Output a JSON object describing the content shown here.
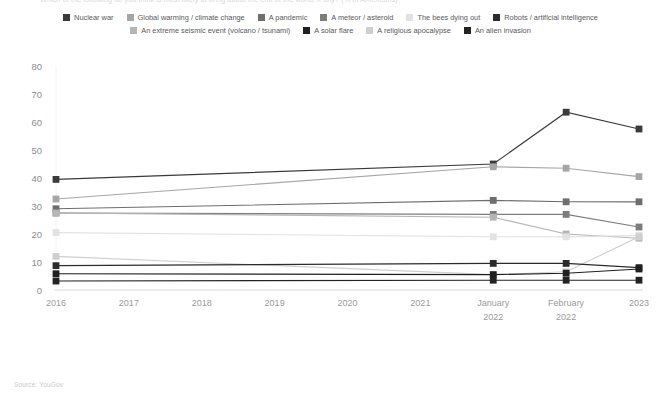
{
  "title": "Which of the following do you think is most likely to bring about the end of the world, if any? (% of Americans)",
  "source": "Source: YouGov",
  "colors": {
    "nuclear_war": "#3a3a3a",
    "global_warming": "#a6a6a6",
    "pandemic": "#6e6e6e",
    "meteor": "#7d7d7d",
    "bees": "#e2e2e2",
    "robots": "#2b2b2b",
    "seismic": "#b5b5b5",
    "solar_flare": "#1f1f1f",
    "religious": "#cfcfcf",
    "alien": "#232323",
    "axis": "#d9d9d9",
    "ytick_text": "#8d8d90",
    "xtick_text": "#9a9a9d"
  },
  "legend": {
    "rows": [
      [
        {
          "label": "Nuclear war",
          "color": "#3a3a3a",
          "swatch": "square-swatch"
        },
        {
          "label": "Global warming / climate change",
          "color": "#a6a6a6",
          "swatch": "square-swatch"
        },
        {
          "label": "A pandemic",
          "color": "#6e6e6e",
          "swatch": "square-swatch"
        },
        {
          "label": "A meteor / asteroid",
          "color": "#7d7d7d",
          "swatch": "square-swatch"
        },
        {
          "label": "The bees dying out",
          "color": "#e2e2e2",
          "swatch": "square-swatch"
        },
        {
          "label": "Robots / artificial intelligence",
          "color": "#2b2b2b",
          "swatch": "square-swatch"
        }
      ],
      [
        {
          "label": "An extreme seismic event (volcano / tsunami)",
          "color": "#b5b5b5",
          "swatch": "square-swatch"
        },
        {
          "label": "A solar flare",
          "color": "#1f1f1f",
          "swatch": "square-swatch"
        },
        {
          "label": "A religious apocalypse",
          "color": "#cfcfcf",
          "swatch": "square-swatch"
        },
        {
          "label": "An alien invasion",
          "color": "#232323",
          "swatch": "square-swatch"
        }
      ]
    ]
  },
  "chart_data": {
    "type": "line",
    "title": "Which of the following do you think is most likely to bring about the end of the world, if any? (% of Americans)",
    "xlabel": "",
    "ylabel": "",
    "ylim": [
      0,
      80
    ],
    "yticks": [
      0,
      10,
      20,
      30,
      40,
      50,
      60,
      70,
      80
    ],
    "grid": false,
    "legend_position": "top",
    "categories": [
      "2016",
      "2017",
      "2018",
      "2019",
      "2020",
      "2021",
      "January 2022",
      "February 2022",
      "2023"
    ],
    "categories_multiline": [
      [
        "2016",
        ""
      ],
      [
        "2017",
        ""
      ],
      [
        "2018",
        ""
      ],
      [
        "2019",
        ""
      ],
      [
        "2020",
        ""
      ],
      [
        "2021",
        ""
      ],
      [
        "January",
        "2022"
      ],
      [
        "February",
        "2022"
      ],
      [
        "2023",
        ""
      ]
    ],
    "series": [
      {
        "name": "Nuclear war",
        "color": "#3a3a3a",
        "values": [
          39.5,
          null,
          null,
          null,
          null,
          null,
          45,
          63.5,
          57.5
        ]
      },
      {
        "name": "Global warming / climate change",
        "color": "#a6a6a6",
        "values": [
          32.5,
          null,
          null,
          null,
          null,
          null,
          44,
          43.5,
          40.5
        ]
      },
      {
        "name": "A pandemic",
        "color": "#6e6e6e",
        "values": [
          29,
          null,
          null,
          null,
          null,
          null,
          32,
          31.5,
          31.5
        ]
      },
      {
        "name": "A meteor / asteroid",
        "color": "#7d7d7d",
        "values": [
          27.5,
          null,
          null,
          null,
          null,
          null,
          27,
          27,
          22.5
        ]
      },
      {
        "name": "An extreme seismic event (volcano / tsunami)",
        "color": "#b5b5b5",
        "values": [
          27.5,
          null,
          null,
          null,
          null,
          null,
          26,
          20,
          18.5
        ]
      },
      {
        "name": "The bees dying out",
        "color": "#e2e2e2",
        "values": [
          20.5,
          null,
          null,
          null,
          null,
          null,
          19,
          19,
          19.5
        ]
      },
      {
        "name": "A religious apocalypse",
        "color": "#cfcfcf",
        "values": [
          12,
          null,
          null,
          null,
          null,
          null,
          5.5,
          6.5,
          19
        ]
      },
      {
        "name": "Robots / artificial intelligence",
        "color": "#2b2b2b",
        "values": [
          8.7,
          null,
          null,
          null,
          null,
          null,
          9.5,
          9.5,
          8
        ]
      },
      {
        "name": "A solar flare",
        "color": "#1f1f1f",
        "values": [
          5.8,
          null,
          null,
          null,
          null,
          null,
          5.5,
          6,
          7.5
        ]
      },
      {
        "name": "An alien invasion",
        "color": "#232323",
        "values": [
          3.2,
          null,
          null,
          null,
          null,
          null,
          3.5,
          3.5,
          3.5
        ]
      }
    ]
  }
}
